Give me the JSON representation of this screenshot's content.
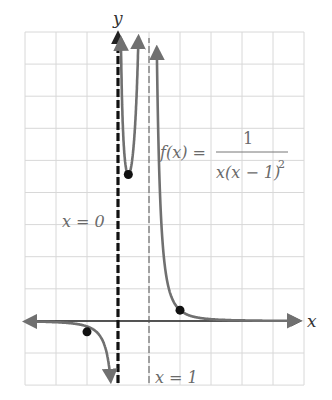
{
  "chart_data": {
    "type": "line",
    "title": "",
    "function_label": "f(x) = 1 / (x(x − 1)^2)",
    "function_parts": {
      "lhs": "f(x) =",
      "numerator": "1",
      "denominator": "x(x − 1)",
      "exponent": "2"
    },
    "xlabel": "x",
    "ylabel": "y",
    "grid": true,
    "xlim": [
      -3,
      6
    ],
    "ylim": [
      -2,
      9
    ],
    "asymptotes": [
      {
        "type": "vertical",
        "x": 0,
        "label": "x = 0",
        "style": "bold-dashed"
      },
      {
        "type": "vertical",
        "x": 1,
        "label": "x = 1",
        "style": "thin-dashed"
      },
      {
        "type": "horizontal",
        "y": 0,
        "label": "",
        "style": "axis"
      }
    ],
    "highlighted_points": [
      {
        "x": -1,
        "y": -0.5
      },
      {
        "x": 0.333,
        "y": 6.75
      },
      {
        "x": 2,
        "y": 0.5
      }
    ],
    "colors": {
      "curve": "#707070",
      "axis": "#222222",
      "grid": "#d8d8d8",
      "point": "#111111"
    }
  },
  "labels": {
    "y_axis": "y",
    "x_axis": "x",
    "asymptote_x0": "x = 0",
    "asymptote_x1": "x = 1",
    "f_lhs": "f(x) =",
    "f_num": "1",
    "f_den": "x(x − 1)",
    "f_exp": "2"
  }
}
